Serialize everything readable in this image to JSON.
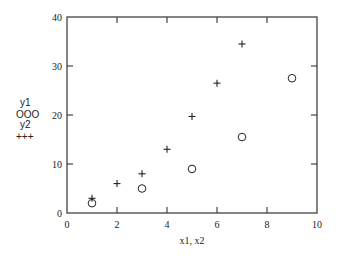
{
  "chart_data": {
    "type": "scatter",
    "title": "",
    "xlabel": "x1, x2",
    "ylabel": "",
    "xlim": [
      0,
      10
    ],
    "ylim": [
      0,
      40
    ],
    "xticks": [
      0,
      2,
      4,
      6,
      8,
      10
    ],
    "yticks": [
      0,
      10,
      20,
      30,
      40
    ],
    "xtick_labels": [
      "0",
      "2",
      "4",
      "6",
      "8",
      "10"
    ],
    "ytick_labels": [
      "0",
      "10",
      "20",
      "30",
      "40"
    ],
    "grid": false,
    "legend_position": "left-outside",
    "series": [
      {
        "name": "y1",
        "marker": "circle",
        "legend_symbol": "OOO",
        "x": [
          1,
          3,
          5,
          7,
          9
        ],
        "y": [
          2,
          5,
          9,
          15.5,
          27.5
        ]
      },
      {
        "name": "y2",
        "marker": "plus",
        "legend_symbol": "+++",
        "x": [
          1,
          2,
          3,
          4,
          5,
          6,
          7
        ],
        "y": [
          3,
          6,
          8,
          13,
          19.7,
          26.5,
          34.5
        ]
      }
    ]
  }
}
